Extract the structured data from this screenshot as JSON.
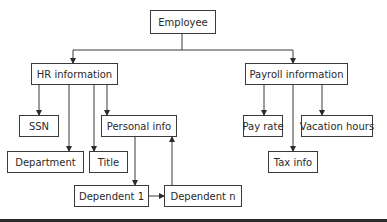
{
  "diagram": {
    "type": "hierarchy",
    "nodes": {
      "employee": "Employee",
      "hr_information": "HR information",
      "payroll_information": "Payroll information",
      "ssn": "SSN",
      "department": "Department",
      "title": "Title",
      "personal_info": "Personal info",
      "dependent_1": "Dependent 1",
      "dependent_n": "Dependent n",
      "pay_rate": "Pay rate",
      "vacation_hours": "Vacation hours",
      "tax_info": "Tax info"
    },
    "edges": [
      {
        "from": "Employee",
        "to": "HR information"
      },
      {
        "from": "Employee",
        "to": "Payroll information"
      },
      {
        "from": "HR information",
        "to": "SSN"
      },
      {
        "from": "HR information",
        "to": "Department"
      },
      {
        "from": "HR information",
        "to": "Title"
      },
      {
        "from": "HR information",
        "to": "Personal info"
      },
      {
        "from": "Personal info",
        "to": "Dependent 1"
      },
      {
        "from": "Dependent 1",
        "to": "Dependent n"
      },
      {
        "from": "Dependent n",
        "to": "Personal info"
      },
      {
        "from": "Payroll information",
        "to": "Pay rate"
      },
      {
        "from": "Payroll information",
        "to": "Tax info"
      },
      {
        "from": "Payroll information",
        "to": "Vacation hours"
      }
    ]
  }
}
